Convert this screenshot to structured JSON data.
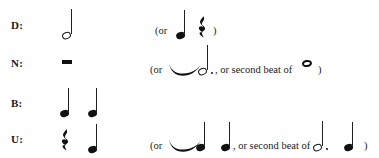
{
  "figure": {
    "type": "music-notation-rhythm-chart",
    "rows": [
      {
        "label": "D:",
        "primary_notation": "half note",
        "alternative_text_open": "(or",
        "alternative_notation": [
          "quarter note",
          "quarter rest"
        ],
        "alternative_text_close": ")"
      },
      {
        "label": "N:",
        "primary_notation": "half rest",
        "alternative_text_open": "(or",
        "alternative_notation": [
          "tie",
          "dotted half note"
        ],
        "alternative_text_middle": ", or second beat of",
        "alternative_notation_2": [
          "whole note"
        ],
        "alternative_text_close": ")"
      },
      {
        "label": "B:",
        "primary_notation": "quarter note, quarter note",
        "alternative_text_open": "",
        "alternative_notation": [],
        "alternative_text_close": ""
      },
      {
        "label": "U:",
        "primary_notation": "quarter rest, quarter note",
        "alternative_text_open": "(or",
        "alternative_notation": [
          "tie",
          "quarter note",
          "quarter note"
        ],
        "alternative_text_middle": ", or second beat of",
        "alternative_notation_2": [
          "dotted half note",
          "quarter note"
        ],
        "alternative_text_close": ")"
      }
    ]
  },
  "labels": {
    "row_d": "D:",
    "row_n": "N:",
    "row_b": "B:",
    "row_u": "U:"
  },
  "text": {
    "or_open": "(or",
    "paren_close": ")",
    "or_second_beat_of": ", or second beat of",
    "comma_or_second_beat_of": ", or second beat of"
  },
  "colors": {
    "ink": "#111111",
    "page": "#ffffff"
  }
}
